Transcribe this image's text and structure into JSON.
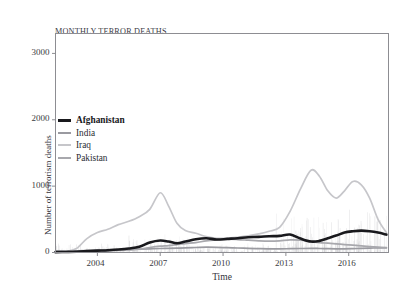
{
  "title_lines": [
    "MONTHLY TERROR DEATHS",
    "BY COUNTRY (TOP 4 - 2002-2017)"
  ],
  "axes": {
    "xlabel": "Time",
    "ylabel": "Number of terrorism deaths",
    "xticks": [
      "2004",
      "2007",
      "2010",
      "2013",
      "2016"
    ],
    "xtick_values": [
      2004,
      2007,
      2010,
      2013,
      2016
    ],
    "yticks": [
      "0",
      "1000",
      "2000",
      "3000"
    ],
    "ytick_values": [
      0,
      1000,
      2000,
      3000
    ],
    "xlim": [
      2002,
      2017.9
    ],
    "ylim": [
      0,
      3300
    ],
    "grid": false,
    "frame": "#8d8d92",
    "plot_bg": "#ffffff"
  },
  "legend": {
    "position": "center-left inside plot",
    "entries": [
      {
        "label": "Afghanistan",
        "color": "#19191d",
        "width": 2.6,
        "emphasis": true
      },
      {
        "label": "India",
        "color": "#9a9aa0",
        "width": 1.7,
        "emphasis": false
      },
      {
        "label": "Iraq",
        "color": "#c6c6ca",
        "width": 1.7,
        "emphasis": false
      },
      {
        "label": "Pakistan",
        "color": "#a8a8ad",
        "width": 1.7,
        "emphasis": false
      }
    ]
  },
  "chart_data": {
    "type": "line",
    "title": "MONTHLY TERROR DEATHS BY COUNTRY (TOP 4 - 2002-2017)",
    "xlabel": "Time",
    "ylabel": "Number of terrorism deaths",
    "xlim": [
      2002,
      2017.9
    ],
    "ylim": [
      0,
      3300
    ],
    "xticks": [
      2004,
      2007,
      2010,
      2013,
      2016
    ],
    "yticks": [
      0,
      1000,
      2000,
      3000
    ],
    "grid": false,
    "legend_position": "center-left",
    "note": "Smoothed monthly death counts per country; faint vertical scatter of raw monthly values visible behind the smooth lines.",
    "x": [
      2002.0,
      2002.5,
      2003.0,
      2003.5,
      2004.0,
      2004.5,
      2005.0,
      2005.5,
      2006.0,
      2006.5,
      2007.0,
      2007.4,
      2007.8,
      2008.2,
      2008.7,
      2009.2,
      2009.7,
      2010.2,
      2010.7,
      2011.2,
      2011.7,
      2012.2,
      2012.7,
      2013.2,
      2013.7,
      2014.2,
      2014.6,
      2015.0,
      2015.4,
      2015.8,
      2016.2,
      2016.6,
      2017.0,
      2017.4,
      2017.8
    ],
    "series": [
      {
        "name": "Iraq",
        "color": "#c6c6ca",
        "width": 1.7,
        "values": [
          10,
          15,
          60,
          210,
          300,
          350,
          420,
          470,
          540,
          650,
          900,
          700,
          440,
          330,
          290,
          240,
          215,
          215,
          230,
          250,
          280,
          320,
          380,
          620,
          960,
          1240,
          1150,
          930,
          820,
          930,
          1070,
          1020,
          820,
          500,
          300
        ]
      },
      {
        "name": "Afghanistan",
        "color": "#19191d",
        "width": 2.6,
        "values": [
          5,
          8,
          12,
          20,
          28,
          35,
          45,
          60,
          85,
          150,
          180,
          165,
          140,
          165,
          200,
          215,
          195,
          205,
          215,
          230,
          235,
          245,
          250,
          270,
          210,
          165,
          175,
          215,
          255,
          300,
          320,
          330,
          320,
          300,
          270
        ]
      },
      {
        "name": "Pakistan",
        "color": "#a8a8ad",
        "width": 1.7,
        "values": [
          4,
          6,
          8,
          12,
          18,
          25,
          30,
          38,
          50,
          75,
          95,
          105,
          120,
          135,
          150,
          175,
          190,
          200,
          195,
          185,
          175,
          170,
          175,
          190,
          185,
          165,
          150,
          140,
          130,
          120,
          110,
          100,
          90,
          80,
          70
        ]
      },
      {
        "name": "India",
        "color": "#9a9aa0",
        "width": 1.7,
        "values": [
          20,
          22,
          25,
          28,
          32,
          35,
          40,
          45,
          50,
          55,
          60,
          62,
          65,
          70,
          75,
          80,
          78,
          72,
          68,
          62,
          58,
          55,
          55,
          58,
          60,
          62,
          60,
          58,
          56,
          55,
          58,
          62,
          66,
          70,
          72
        ]
      }
    ],
    "scatter_note": "Raw monthly points scattered 0-1500, densest for Iraq 2013-2017 and Afghanistan 2015-2017"
  }
}
